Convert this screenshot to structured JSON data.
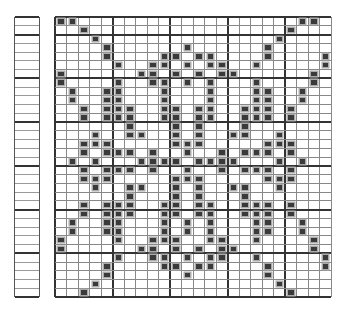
{
  "pattern": {
    "columns": 24,
    "rows": 32,
    "major_every_cols": 5,
    "major_col_offset": 0,
    "major_every_rows": 5,
    "major_row_offset": 2,
    "fill_color": "#3a3a3a",
    "line_color": "#888888",
    "major_line_color": "#333333",
    "filled": [
      [
        0,
        1,
        21,
        22
      ],
      [
        2,
        20
      ],
      [
        3,
        19
      ],
      [
        4,
        11,
        18
      ],
      [
        4,
        9,
        10,
        12,
        13,
        18,
        23
      ],
      [
        5,
        8,
        9,
        11,
        13,
        14,
        17,
        23
      ],
      [
        0,
        7,
        8,
        10,
        12,
        14,
        15,
        22
      ],
      [
        0,
        5,
        8,
        9,
        11,
        13,
        17,
        22
      ],
      [
        1,
        4,
        5,
        9,
        13,
        17,
        18,
        21
      ],
      [
        1,
        4,
        5,
        9,
        13,
        17,
        18,
        21
      ],
      [
        2,
        4,
        5,
        6,
        9,
        10,
        12,
        13,
        16,
        17,
        18,
        20
      ],
      [
        2,
        4,
        5,
        6,
        9,
        10,
        12,
        13,
        16,
        17,
        18,
        20
      ],
      [
        6,
        10,
        12,
        16
      ],
      [
        3,
        6,
        7,
        10,
        12,
        15,
        16,
        19
      ],
      [
        2,
        3,
        4,
        10,
        11,
        12,
        18,
        19,
        20
      ],
      [
        2,
        4,
        5,
        6,
        8,
        11,
        14,
        16,
        17,
        18,
        20
      ],
      [
        1,
        3,
        7,
        8,
        9,
        10,
        12,
        13,
        14,
        15,
        19,
        21
      ],
      [
        2,
        4,
        5,
        6,
        8,
        11,
        14,
        16,
        17,
        18,
        20
      ],
      [
        2,
        3,
        4,
        10,
        11,
        12,
        18,
        19,
        20
      ],
      [
        3,
        6,
        7,
        10,
        12,
        15,
        16,
        19
      ],
      [
        6,
        10,
        12,
        16
      ],
      [
        2,
        4,
        5,
        6,
        9,
        10,
        12,
        13,
        16,
        17,
        18,
        20
      ],
      [
        2,
        4,
        5,
        6,
        9,
        10,
        12,
        13,
        16,
        17,
        18,
        20
      ],
      [
        1,
        4,
        5,
        9,
        11,
        13,
        17,
        18,
        21
      ],
      [
        1,
        4,
        5,
        9,
        11,
        13,
        17,
        18,
        21
      ],
      [
        0,
        5,
        8,
        9,
        10,
        13,
        14,
        17,
        22
      ],
      [
        0,
        7,
        8,
        10,
        12,
        14,
        15,
        22
      ],
      [
        5,
        8,
        9,
        11,
        13,
        14,
        17,
        23
      ],
      [
        4,
        9,
        10,
        12,
        13,
        18,
        23
      ],
      [
        4,
        11,
        18
      ],
      [
        3,
        19
      ],
      [
        2,
        20
      ]
    ]
  },
  "side_strip": {
    "rows": 32,
    "major_every_rows": 5,
    "major_row_offset": 2
  }
}
